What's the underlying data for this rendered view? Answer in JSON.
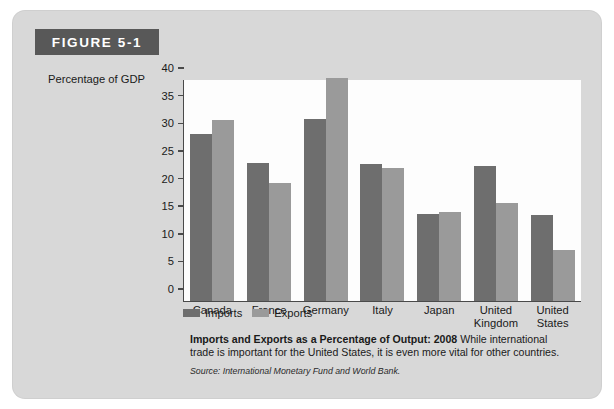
{
  "figure": {
    "tab_label": "FIGURE 5-1"
  },
  "chart_data": {
    "type": "bar",
    "title": "Imports and Exports as a Percentage of Output: 2008",
    "xlabel": "",
    "ylabel": "Percentage of GDP",
    "ylim": [
      0,
      40
    ],
    "yticks": [
      0,
      5,
      10,
      15,
      20,
      25,
      30,
      35,
      40
    ],
    "grid": false,
    "legend_position": "bottom-left",
    "categories": [
      "Canada",
      "France",
      "Germany",
      "Italy",
      "Japan",
      "United Kingdom",
      "United States"
    ],
    "series": [
      {
        "name": "Imports",
        "color": "#6e6e6e",
        "values": [
          30.2,
          25.0,
          33.0,
          24.8,
          15.8,
          24.4,
          15.6
        ]
      },
      {
        "name": "Exports",
        "color": "#9a9a9a",
        "values": [
          32.8,
          21.4,
          40.4,
          24.1,
          16.2,
          17.7,
          9.2
        ]
      }
    ]
  },
  "caption": {
    "title": "Imports and Exports as a Percentage of Output: 2008",
    "body": "While international trade is important for the United States, it is even more vital for other countries.",
    "source": "Source: International Monetary Fund and World Bank."
  }
}
